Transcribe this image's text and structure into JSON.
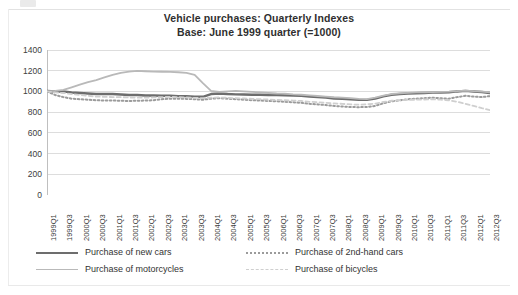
{
  "chart_data": {
    "type": "line",
    "title": "Vehicle purchases:  Quarterly Indexes",
    "subtitle": "Base: June 1999 quarter (=1000)",
    "xlabel": "",
    "ylabel": "",
    "ylim": [
      0,
      1400
    ],
    "yticks": [
      0,
      200,
      400,
      600,
      800,
      1000,
      1200,
      1400
    ],
    "grid": true,
    "legend_position": "bottom",
    "x": [
      "1999Q1",
      "1999Q2",
      "1999Q3",
      "1999Q4",
      "2000Q1",
      "2000Q2",
      "2000Q3",
      "2000Q4",
      "2001Q1",
      "2001Q2",
      "2001Q3",
      "2001Q4",
      "2002Q1",
      "2002Q2",
      "2002Q3",
      "2002Q4",
      "2003Q1",
      "2003Q2",
      "2003Q3",
      "2003Q4",
      "2004Q1",
      "2004Q2",
      "2004Q3",
      "2004Q4",
      "2005Q1",
      "2005Q2",
      "2005Q3",
      "2005Q4",
      "2006Q1",
      "2006Q2",
      "2006Q3",
      "2006Q4",
      "2007Q1",
      "2007Q2",
      "2007Q3",
      "2007Q4",
      "2008Q1",
      "2008Q2",
      "2008Q3",
      "2008Q4",
      "2009Q1",
      "2009Q2",
      "2009Q3",
      "2009Q4",
      "2010Q1",
      "2010Q2",
      "2010Q3",
      "2010Q4",
      "2011Q1",
      "2011Q2",
      "2011Q3",
      "2011Q4",
      "2012Q1",
      "2012Q2",
      "2012Q3"
    ],
    "xtick_labels": [
      "1999Q1",
      "1999Q3",
      "2000Q1",
      "2000Q3",
      "2001Q1",
      "2001Q3",
      "2002Q1",
      "2002Q3",
      "2003Q1",
      "2003Q3",
      "2004Q1",
      "2004Q3",
      "2005Q1",
      "2005Q3",
      "2006Q1",
      "2006Q3",
      "2007Q1",
      "2007Q3",
      "2008Q1",
      "2008Q3",
      "2009Q1",
      "2009Q3",
      "2010Q1",
      "2010Q3",
      "2011Q1",
      "2011Q3",
      "2012Q1",
      "2012Q3"
    ],
    "series": [
      {
        "name": "Purchase of new cars",
        "style": "solid",
        "color": "#6d6d6d",
        "width": 2.4,
        "values": [
          1005,
          1000,
          1000,
          990,
          985,
          980,
          975,
          975,
          975,
          970,
          965,
          965,
          960,
          960,
          958,
          958,
          955,
          955,
          950,
          948,
          975,
          980,
          975,
          972,
          970,
          968,
          968,
          966,
          965,
          962,
          960,
          958,
          950,
          945,
          940,
          932,
          928,
          925,
          920,
          918,
          930,
          952,
          968,
          975,
          980,
          982,
          985,
          988,
          990,
          992,
          1000,
          1005,
          1000,
          995,
          985
        ]
      },
      {
        "name": "Purchase of 2nd-hand cars",
        "style": "dotted",
        "color": "#9b9b9b",
        "width": 2.0,
        "values": [
          1000,
          965,
          945,
          930,
          925,
          920,
          915,
          912,
          912,
          910,
          908,
          910,
          912,
          915,
          925,
          930,
          930,
          928,
          925,
          920,
          930,
          935,
          930,
          925,
          920,
          915,
          912,
          908,
          905,
          900,
          895,
          890,
          880,
          875,
          868,
          860,
          855,
          850,
          848,
          850,
          860,
          885,
          905,
          915,
          925,
          930,
          935,
          940,
          935,
          930,
          945,
          958,
          950,
          945,
          955
        ]
      },
      {
        "name": "Purchase of motorcycles",
        "style": "solid",
        "color": "#b9b9b9",
        "width": 1.8,
        "values": [
          1000,
          1005,
          1015,
          1040,
          1065,
          1090,
          1110,
          1135,
          1160,
          1180,
          1192,
          1198,
          1195,
          1192,
          1190,
          1188,
          1185,
          1180,
          1160,
          1080,
          1005,
          995,
          1000,
          1005,
          1000,
          995,
          990,
          985,
          980,
          978,
          972,
          968,
          962,
          956,
          950,
          944,
          940,
          935,
          928,
          925,
          940,
          960,
          975,
          982,
          986,
          990,
          992,
          994,
          996,
          998,
          1002,
          1008,
          1002,
          998,
          992
        ]
      },
      {
        "name": "Purchase of bicycles",
        "style": "dashed",
        "color": "#cfcfcf",
        "width": 1.8,
        "values": [
          1000,
          990,
          985,
          975,
          965,
          958,
          950,
          948,
          945,
          945,
          942,
          940,
          940,
          942,
          945,
          948,
          945,
          942,
          938,
          935,
          940,
          942,
          938,
          935,
          932,
          928,
          925,
          922,
          918,
          915,
          912,
          908,
          900,
          895,
          890,
          885,
          880,
          875,
          872,
          875,
          882,
          898,
          910,
          915,
          918,
          920,
          922,
          925,
          920,
          915,
          900,
          880,
          860,
          838,
          820
        ]
      }
    ]
  },
  "legend": {
    "items": [
      {
        "label": "Purchase of new cars",
        "swatch": "sw-solid-dark"
      },
      {
        "label": "Purchase of 2nd-hand cars",
        "swatch": "sw-dotted"
      },
      {
        "label": "Purchase of motorcycles",
        "swatch": "sw-solid-light"
      },
      {
        "label": "Purchase of bicycles",
        "swatch": "sw-dashed"
      }
    ]
  },
  "colors": {
    "grid": "#d9d9d9",
    "axis": "#bfbfbf",
    "text": "#3d3d3d"
  }
}
